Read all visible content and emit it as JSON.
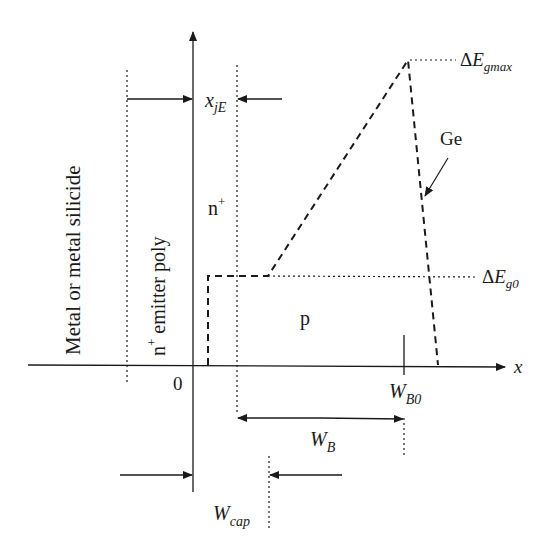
{
  "diagram": {
    "title": "",
    "axes": {
      "x_label": "x",
      "origin_label": "0"
    },
    "regions": {
      "metal": "Metal or metal silicide",
      "poly_prefix": "n",
      "poly_sup": "+",
      "poly_suffix": " emitter poly",
      "emitter_main": "n",
      "emitter_sup": "+",
      "base": "p"
    },
    "labels": {
      "xjE_main": "x",
      "xjE_sub": "jE",
      "dEgmax_delta": "Δ",
      "dEgmax_main": "E",
      "dEgmax_sub": "gmax",
      "dEg0_delta": "Δ",
      "dEg0_main": "E",
      "dEg0_sub": "g0",
      "ge": "Ge",
      "WB0_main": "W",
      "WB0_sub": "B0",
      "WB_main": "W",
      "WB_sub": "B",
      "Wcap_main": "W",
      "Wcap_sub": "cap"
    },
    "colors": {
      "ink": "#1a1a1a",
      "background": "#ffffff"
    },
    "profile_points": [
      [
        208,
        365
      ],
      [
        208,
        276
      ],
      [
        268,
        276
      ],
      [
        408,
        60
      ],
      [
        438,
        365
      ]
    ]
  }
}
